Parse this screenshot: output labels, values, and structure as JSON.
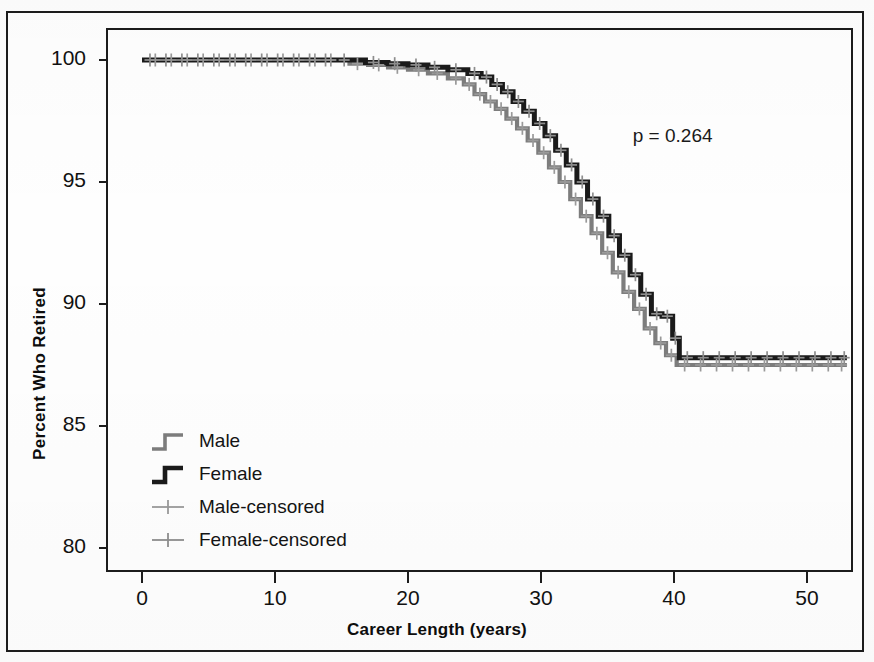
{
  "chart_data": {
    "type": "line",
    "subtype": "kaplan-meier-step",
    "title": "",
    "xlabel": "Career Length (years)",
    "ylabel": "Percent Who Retired",
    "xlim": [
      0,
      53
    ],
    "ylim": [
      79.0,
      101.0
    ],
    "xticks": [
      0,
      10,
      20,
      30,
      40,
      50
    ],
    "yticks": [
      80,
      85,
      90,
      95,
      100
    ],
    "xtick_labels": [
      "0",
      "10",
      "20",
      "30",
      "40",
      "50"
    ],
    "ytick_labels": [
      "80",
      "95",
      "90",
      "95",
      "100"
    ],
    "grid": false,
    "legend_position": "lower-left",
    "annotations": [
      {
        "text": "p = 0.264",
        "x": 37.5,
        "y": 96.8
      }
    ],
    "series": [
      {
        "name": "Male",
        "color": "#7d7d7d",
        "style": "step",
        "points": [
          [
            0,
            100.0
          ],
          [
            15.0,
            100.0
          ],
          [
            15.6,
            99.85
          ],
          [
            17.0,
            99.8
          ],
          [
            18.5,
            99.7
          ],
          [
            20.0,
            99.6
          ],
          [
            21.5,
            99.45
          ],
          [
            23.0,
            99.25
          ],
          [
            24.2,
            99.0
          ],
          [
            25.0,
            98.6
          ],
          [
            25.8,
            98.3
          ],
          [
            26.6,
            98.0
          ],
          [
            27.4,
            97.6
          ],
          [
            28.2,
            97.2
          ],
          [
            29.0,
            96.7
          ],
          [
            29.8,
            96.2
          ],
          [
            30.6,
            95.6
          ],
          [
            31.4,
            95.0
          ],
          [
            32.2,
            94.3
          ],
          [
            33.0,
            93.6
          ],
          [
            33.8,
            92.9
          ],
          [
            34.6,
            92.1
          ],
          [
            35.4,
            91.3
          ],
          [
            36.2,
            90.5
          ],
          [
            37.0,
            89.8
          ],
          [
            37.8,
            89.0
          ],
          [
            38.6,
            88.4
          ],
          [
            39.4,
            87.9
          ],
          [
            40.2,
            87.5
          ],
          [
            53.0,
            87.5
          ]
        ]
      },
      {
        "name": "Female",
        "color": "#1a1a1a",
        "style": "step",
        "points": [
          [
            0,
            100.0
          ],
          [
            16.0,
            100.0
          ],
          [
            16.8,
            99.9
          ],
          [
            18.5,
            99.85
          ],
          [
            20.0,
            99.8
          ],
          [
            21.5,
            99.7
          ],
          [
            23.0,
            99.6
          ],
          [
            24.5,
            99.45
          ],
          [
            25.5,
            99.3
          ],
          [
            26.3,
            99.0
          ],
          [
            27.1,
            98.7
          ],
          [
            27.9,
            98.3
          ],
          [
            28.7,
            97.9
          ],
          [
            29.5,
            97.4
          ],
          [
            30.3,
            96.9
          ],
          [
            31.1,
            96.3
          ],
          [
            31.9,
            95.7
          ],
          [
            32.7,
            95.0
          ],
          [
            33.5,
            94.3
          ],
          [
            34.3,
            93.6
          ],
          [
            35.1,
            92.8
          ],
          [
            35.9,
            92.0
          ],
          [
            36.7,
            91.2
          ],
          [
            37.5,
            90.4
          ],
          [
            38.3,
            89.6
          ],
          [
            39.1,
            89.5
          ],
          [
            39.9,
            88.6
          ],
          [
            40.4,
            87.8
          ],
          [
            53.0,
            87.8
          ]
        ]
      }
    ],
    "censor_marks": [
      {
        "series": "Male",
        "color": "#9a9a9a",
        "points": [
          [
            1.0,
            100.0
          ],
          [
            2.2,
            100.0
          ],
          [
            3.4,
            100.0
          ],
          [
            4.6,
            100.0
          ],
          [
            5.8,
            100.0
          ],
          [
            7.0,
            100.0
          ],
          [
            8.2,
            100.0
          ],
          [
            9.4,
            100.0
          ],
          [
            10.6,
            100.0
          ],
          [
            11.8,
            100.0
          ],
          [
            13.0,
            100.0
          ],
          [
            14.2,
            100.0
          ],
          [
            16.2,
            99.85
          ],
          [
            17.8,
            99.8
          ],
          [
            19.2,
            99.7
          ],
          [
            20.8,
            99.6
          ],
          [
            22.2,
            99.45
          ],
          [
            23.6,
            99.25
          ],
          [
            24.6,
            99.0
          ],
          [
            25.4,
            98.6
          ],
          [
            26.2,
            98.3
          ],
          [
            27.0,
            98.0
          ],
          [
            27.8,
            97.6
          ],
          [
            28.6,
            97.2
          ],
          [
            29.4,
            96.7
          ],
          [
            30.2,
            96.2
          ],
          [
            31.0,
            95.6
          ],
          [
            31.8,
            95.0
          ],
          [
            32.6,
            94.3
          ],
          [
            33.4,
            93.6
          ],
          [
            34.2,
            92.9
          ],
          [
            35.0,
            92.1
          ],
          [
            35.8,
            91.3
          ],
          [
            36.6,
            90.5
          ],
          [
            37.4,
            89.8
          ],
          [
            38.2,
            89.0
          ],
          [
            39.0,
            88.4
          ],
          [
            39.8,
            87.9
          ],
          [
            40.8,
            87.5
          ],
          [
            42.0,
            87.5
          ],
          [
            43.2,
            87.5
          ],
          [
            44.4,
            87.5
          ],
          [
            45.6,
            87.5
          ],
          [
            46.8,
            87.5
          ],
          [
            48.0,
            87.5
          ],
          [
            49.2,
            87.5
          ],
          [
            50.4,
            87.5
          ],
          [
            51.6,
            87.5
          ],
          [
            52.6,
            87.5
          ]
        ]
      },
      {
        "series": "Female",
        "color": "#8e8e8e",
        "points": [
          [
            0.6,
            100.0
          ],
          [
            1.8,
            100.0
          ],
          [
            3.0,
            100.0
          ],
          [
            4.2,
            100.0
          ],
          [
            5.4,
            100.0
          ],
          [
            6.6,
            100.0
          ],
          [
            7.8,
            100.0
          ],
          [
            9.0,
            100.0
          ],
          [
            10.2,
            100.0
          ],
          [
            11.4,
            100.0
          ],
          [
            12.6,
            100.0
          ],
          [
            13.8,
            100.0
          ],
          [
            15.2,
            100.0
          ],
          [
            17.4,
            99.9
          ],
          [
            19.0,
            99.85
          ],
          [
            20.6,
            99.8
          ],
          [
            22.0,
            99.7
          ],
          [
            23.6,
            99.6
          ],
          [
            25.0,
            99.45
          ],
          [
            25.9,
            99.3
          ],
          [
            26.7,
            99.0
          ],
          [
            27.5,
            98.7
          ],
          [
            28.3,
            98.3
          ],
          [
            29.1,
            97.9
          ],
          [
            29.9,
            97.4
          ],
          [
            30.7,
            96.9
          ],
          [
            31.5,
            96.3
          ],
          [
            32.3,
            95.7
          ],
          [
            33.1,
            95.0
          ],
          [
            33.9,
            94.3
          ],
          [
            34.7,
            93.6
          ],
          [
            35.5,
            92.8
          ],
          [
            36.3,
            92.0
          ],
          [
            37.1,
            91.2
          ],
          [
            37.9,
            90.4
          ],
          [
            38.7,
            89.6
          ],
          [
            39.5,
            89.5
          ],
          [
            40.1,
            88.6
          ],
          [
            41.0,
            87.8
          ],
          [
            42.2,
            87.8
          ],
          [
            43.4,
            87.8
          ],
          [
            44.6,
            87.8
          ],
          [
            45.8,
            87.8
          ],
          [
            47.0,
            87.8
          ],
          [
            48.2,
            87.8
          ],
          [
            49.4,
            87.8
          ],
          [
            50.6,
            87.8
          ],
          [
            51.8,
            87.8
          ],
          [
            52.8,
            87.8
          ]
        ]
      }
    ],
    "legend": [
      {
        "label": "Male",
        "color": "#7d7d7d",
        "glyph": "step"
      },
      {
        "label": "Female",
        "color": "#1a1a1a",
        "glyph": "step"
      },
      {
        "label": "Male-censored",
        "color": "#9a9a9a",
        "glyph": "plus"
      },
      {
        "label": "Female-censored",
        "color": "#8e8e8e",
        "glyph": "plus"
      }
    ]
  }
}
